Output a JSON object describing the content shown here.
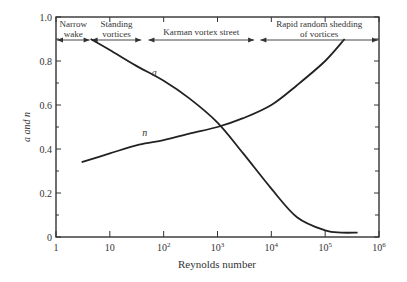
{
  "chart_data": {
    "type": "line",
    "title": "",
    "xlabel": "Reynolds number",
    "ylabel": "a and n",
    "xscale": "log",
    "xlim": [
      1,
      1000000
    ],
    "ylim": [
      0,
      1.0
    ],
    "grid": false,
    "x_ticks": [
      {
        "value": 1,
        "label": "1",
        "sup": ""
      },
      {
        "value": 10,
        "label": "10",
        "sup": ""
      },
      {
        "value": 100,
        "label": "10",
        "sup": "2"
      },
      {
        "value": 1000,
        "label": "10",
        "sup": "3"
      },
      {
        "value": 10000,
        "label": "10",
        "sup": "4"
      },
      {
        "value": 100000,
        "label": "10",
        "sup": "5"
      },
      {
        "value": 1000000,
        "label": "10",
        "sup": "6"
      }
    ],
    "y_ticks": [
      {
        "value": 0,
        "label": "0"
      },
      {
        "value": 0.2,
        "label": "0.2"
      },
      {
        "value": 0.4,
        "label": "0.4"
      },
      {
        "value": 0.6,
        "label": "0.6"
      },
      {
        "value": 0.8,
        "label": "0.8"
      },
      {
        "value": 1.0,
        "label": "1.0"
      }
    ],
    "y_minor_ticks": [
      0.1,
      0.3,
      0.5,
      0.7,
      0.9
    ],
    "series": [
      {
        "name": "a",
        "label": "a",
        "label_at": {
          "x": 60,
          "y": 0.73
        },
        "points": [
          [
            4.4,
            0.9
          ],
          [
            10,
            0.85
          ],
          [
            30,
            0.78
          ],
          [
            100,
            0.71
          ],
          [
            300,
            0.63
          ],
          [
            1000,
            0.52
          ],
          [
            3000,
            0.38
          ],
          [
            10000,
            0.22
          ],
          [
            30000,
            0.09
          ],
          [
            100000,
            0.03
          ],
          [
            200000,
            0.02
          ],
          [
            400000,
            0.02
          ]
        ]
      },
      {
        "name": "n",
        "label": "n",
        "label_at": {
          "x": 40,
          "y": 0.46
        },
        "points": [
          [
            3,
            0.34
          ],
          [
            10,
            0.38
          ],
          [
            35,
            0.42
          ],
          [
            100,
            0.44
          ],
          [
            300,
            0.47
          ],
          [
            1000,
            0.5
          ],
          [
            3000,
            0.54
          ],
          [
            10000,
            0.6
          ],
          [
            30000,
            0.69
          ],
          [
            100000,
            0.8
          ],
          [
            230000,
            0.9
          ]
        ]
      }
    ],
    "regions": [
      {
        "name": "Narrow wake",
        "lines": [
          "Narrow",
          "wake"
        ],
        "from": 1,
        "to": 4.4
      },
      {
        "name": "Standing vortices",
        "lines": [
          "Standing",
          "vortices"
        ],
        "from": 4.4,
        "to": 40
      },
      {
        "name": "Karman vortex street",
        "lines": [
          "Karman vortex street"
        ],
        "from": 50,
        "to": 5000
      },
      {
        "name": "Rapid random shedding of vortices",
        "lines": [
          "Rapid random shedding",
          "of vortices"
        ],
        "from": 6000,
        "to": 1000000
      }
    ],
    "legend": null
  }
}
